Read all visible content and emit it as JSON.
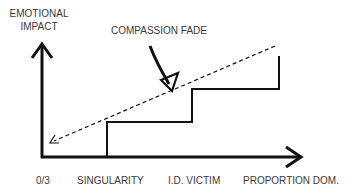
{
  "diagram": {
    "y_axis_label_line1": "EMOTIONAL",
    "y_axis_label_line2": "IMPACT",
    "annotation": "COMPASSION FADE",
    "x_ticks": [
      "0/3",
      "SINGULARITY",
      "I.D. VICTIM",
      "PROPORTION DOM."
    ],
    "colors": {
      "ink": "#111111",
      "text": "#3a3a3a",
      "background": "#ffffff"
    }
  }
}
